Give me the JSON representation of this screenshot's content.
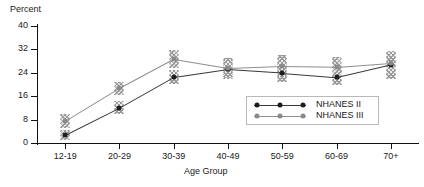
{
  "chart_data": {
    "type": "line",
    "title": "",
    "xlabel": "Age Group",
    "ylabel": "Percent",
    "categories": [
      "12-19",
      "20-29",
      "30-39",
      "40-49",
      "50-59",
      "60-69",
      "70+"
    ],
    "ylim": [
      0,
      40
    ],
    "yticks": [
      0,
      8,
      16,
      24,
      32,
      40
    ],
    "grid": false,
    "legend_position": "center-right-inside",
    "series": [
      {
        "name": "NHANES II",
        "color": "#1d1d1d",
        "values": [
          2.7,
          12.0,
          22.5,
          25.2,
          24.0,
          22.5,
          26.8
        ],
        "errors_low": [
          1.0,
          9.8,
          20.2,
          22.0,
          21.0,
          19.8,
          22.0
        ],
        "errors_high": [
          4.5,
          14.2,
          24.8,
          28.2,
          27.0,
          25.2,
          31.5
        ]
      },
      {
        "name": "NHANES III",
        "color": "#8a8a8a",
        "values": [
          7.5,
          18.8,
          28.7,
          25.6,
          26.3,
          26.0,
          27.4
        ],
        "errors_low": [
          5.0,
          16.5,
          25.5,
          22.5,
          23.0,
          22.8,
          22.0
        ],
        "errors_high": [
          10.0,
          21.0,
          31.8,
          29.0,
          30.0,
          29.5,
          31.5
        ]
      }
    ]
  },
  "axes": {
    "y_title": "Percent",
    "x_title": "Age Group",
    "y_tick_labels": [
      "40",
      "32",
      "24",
      "16",
      "8",
      "0"
    ],
    "x_tick_labels": [
      "12-19",
      "20-29",
      "30-39",
      "40-49",
      "50-59",
      "60-69",
      "70+"
    ]
  },
  "legend": {
    "entries": [
      {
        "label": "NHANES II"
      },
      {
        "label": "NHANES III"
      }
    ]
  }
}
